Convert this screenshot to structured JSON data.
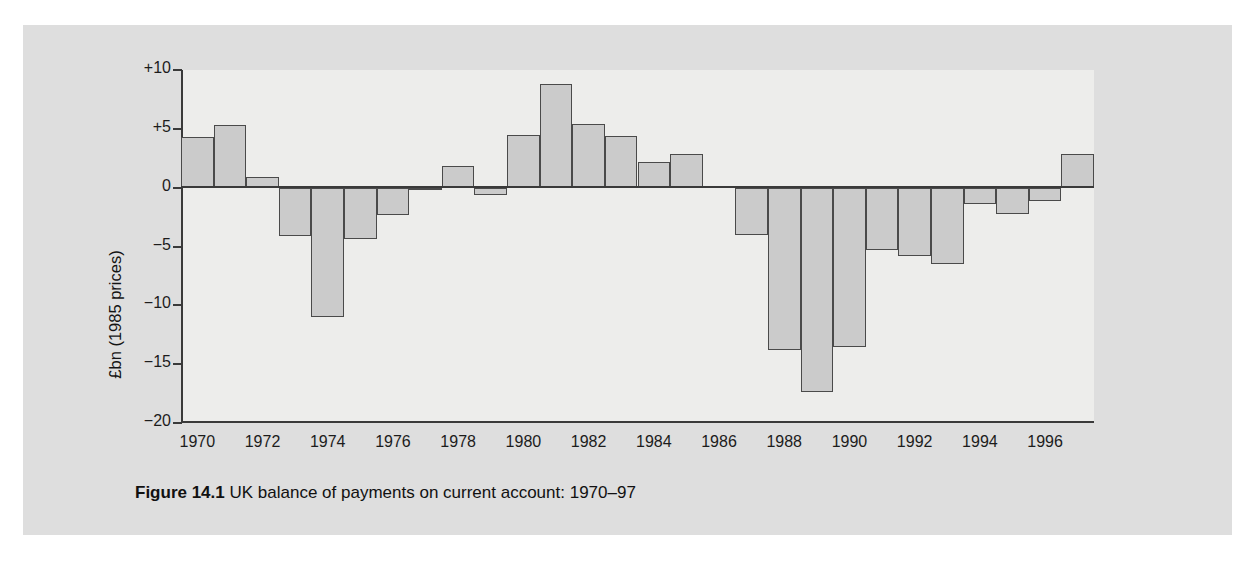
{
  "figure": {
    "caption_label": "Figure 14.1",
    "caption_text": "UK balance of payments on current account: 1970–97"
  },
  "axes": {
    "y_title": "£bn (1985 prices)",
    "y_ticks": [
      "+10",
      "+5",
      "0",
      "−5",
      "−10",
      "−15",
      "−20"
    ],
    "x_ticks": [
      "1970",
      "1972",
      "1974",
      "1976",
      "1978",
      "1980",
      "1982",
      "1984",
      "1986",
      "1988",
      "1990",
      "1992",
      "1994",
      "1996"
    ]
  },
  "colors": {
    "panel_background": "#dedede",
    "plot_background": "#ededeb",
    "bar_fill": "#cbcbcb",
    "bar_stroke": "#4a4a4a",
    "axis": "#3a3a3a",
    "text": "#1c1c1c"
  },
  "chart_data": {
    "type": "bar",
    "title": "UK balance of payments on current account: 1970–97",
    "xlabel": "",
    "ylabel": "£bn (1985 prices)",
    "ylim": [
      -20,
      10
    ],
    "ytick_values": [
      10,
      5,
      0,
      -5,
      -10,
      -15,
      -20
    ],
    "ytick_labels": [
      "+10",
      "+5",
      "0",
      "−5",
      "−10",
      "−15",
      "−20"
    ],
    "xtick_labels": [
      "1970",
      "1972",
      "1974",
      "1976",
      "1978",
      "1980",
      "1982",
      "1984",
      "1986",
      "1988",
      "1990",
      "1992",
      "1994",
      "1996"
    ],
    "grid": false,
    "legend": null,
    "categories": [
      "1970",
      "1971",
      "1972",
      "1973",
      "1974",
      "1975",
      "1976",
      "1977",
      "1978",
      "1979",
      "1980",
      "1981",
      "1982",
      "1983",
      "1984",
      "1985",
      "1986",
      "1987",
      "1988",
      "1989",
      "1990",
      "1991",
      "1992",
      "1993",
      "1994",
      "1995",
      "1996",
      "1997"
    ],
    "values": [
      4.3,
      5.3,
      0.9,
      -4.1,
      -11.0,
      -4.4,
      -2.3,
      -0.2,
      1.8,
      -0.6,
      4.5,
      8.8,
      5.4,
      4.4,
      2.2,
      2.9,
      0.1,
      -4.0,
      -13.8,
      -17.4,
      -13.5,
      -5.3,
      -5.8,
      -6.5,
      -1.4,
      -2.2,
      -1.1,
      2.9
    ]
  }
}
